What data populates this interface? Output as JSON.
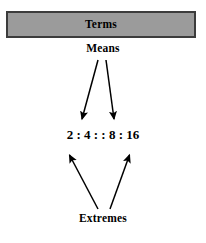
{
  "diagram": {
    "title_box": {
      "label": "Terms",
      "fill_color": "#9b9b9b",
      "border_color": "#3c3c3c"
    },
    "top_label": "Means",
    "bottom_label": "Extremes",
    "proportion": {
      "full_text": "2 : 4 : : 8 : 16",
      "terms": [
        "2",
        "4",
        "8",
        "16"
      ],
      "inner_separator": ":",
      "proportion_separator": ": :"
    },
    "arrows": {
      "means_arrows": [
        {
          "name": "means-to-4",
          "from_x": 98,
          "from_y": 60,
          "to_x": 82,
          "to_y": 122
        },
        {
          "name": "means-to-8",
          "from_x": 106,
          "from_y": 60,
          "to_x": 114,
          "to_y": 122
        }
      ],
      "extremes_arrows": [
        {
          "name": "extremes-to-2",
          "from_x": 98,
          "from_y": 209,
          "to_x": 68,
          "to_y": 152
        },
        {
          "name": "extremes-to-16",
          "from_x": 110,
          "from_y": 209,
          "to_x": 131,
          "to_y": 152
        }
      ],
      "stroke_color": "#000000"
    }
  }
}
